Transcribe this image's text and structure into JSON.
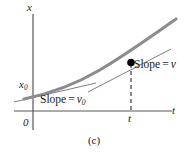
{
  "figure": {
    "caption": "(c)",
    "background_color": "#ffffff",
    "axes": {
      "vertical_axis_label": "x",
      "horizontal_axis_label": "t",
      "origin_label": "0",
      "axis_color": "#58585a",
      "vertical_axis": {
        "x": 33,
        "y_top": 14,
        "y_bottom": 130
      },
      "horizontal_axis": {
        "y": 111,
        "x_left": 14,
        "x_right": 172
      }
    },
    "y_intercept": {
      "label": "x",
      "subscript": "0",
      "value_y": 95
    },
    "time_marker": {
      "label": "t",
      "x": 131
    },
    "annotations": [
      {
        "name": "slope-v0",
        "prefix": "Slope",
        "equals": "=",
        "symbol": "v",
        "subscript": "0"
      },
      {
        "name": "slope-v",
        "prefix": "Slope",
        "equals": "=",
        "symbol": "v",
        "subscript": ""
      }
    ],
    "colors": {
      "curve": "#8c8c8e",
      "tangent": "#6e6e70",
      "dashed": "#4a4a4c",
      "point": "#000000",
      "text": "#1a1a1a"
    },
    "curve": {
      "type": "parabola",
      "description": "position vs time, concave up",
      "path": "M 24 98 C 50 92, 86 78, 110 62 C 132 47, 152 33, 176 19"
    },
    "tangent_initial": {
      "description": "tangent line at t = 0 with slope v0",
      "path": "M 14 101 L 92 84"
    },
    "tangent_at_t": {
      "description": "tangent line at time t with slope v",
      "path": "M 90 91 L 170 50"
    },
    "marked_point": {
      "x": 131,
      "y": 63,
      "radius": 4
    },
    "dashed_drop_line": {
      "x": 131,
      "y_top": 63,
      "y_bottom": 111
    }
  }
}
